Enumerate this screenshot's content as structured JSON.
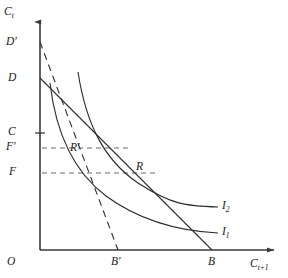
{
  "figure": {
    "background_color": "#ffffff",
    "line_color": "#2e2e2e",
    "axis_color": "#3a3a3a",
    "guide_color": "#6d6d6d"
  },
  "axes": {
    "y_label": "C",
    "y_label_sub": "t",
    "x_label": "C",
    "x_label_sub": "t+1",
    "origin_label": "O",
    "x_axis_y_px": 250,
    "y_axis_x_px": 40,
    "x_axis_end_px": 278,
    "y_axis_top_px": 18
  },
  "y_axis_marks": [
    {
      "label": "D",
      "prime": "′",
      "text": "D′",
      "y_px": 42,
      "has_tick": false
    },
    {
      "label": "D",
      "prime": "",
      "text": "D",
      "y_px": 78,
      "has_tick": false
    },
    {
      "label": "C",
      "prime": "",
      "text": "C",
      "y_px": 133,
      "has_tick": true
    },
    {
      "label": "F",
      "prime": "′",
      "text": "F′",
      "y_px": 148,
      "has_tick": false
    },
    {
      "label": "F",
      "prime": "",
      "text": "F",
      "y_px": 173,
      "has_tick": false
    }
  ],
  "x_axis_marks": [
    {
      "text": "B′",
      "x_px": 118
    },
    {
      "text": "B",
      "x_px": 212
    }
  ],
  "points": [
    {
      "text": "R′",
      "name": "point-r-prime",
      "x_px": 65,
      "y_px": 148
    },
    {
      "text": "R",
      "name": "point-r",
      "x_px": 130,
      "y_px": 173
    }
  ],
  "curves": [
    {
      "name": "indifference-curve-i1",
      "label": "I",
      "label_sub": "1",
      "label_text": "I₁",
      "style": "solid",
      "path": "M 50,83 C 56,135 74,172 106,196 C 140,221 180,231 218,233"
    },
    {
      "name": "indifference-curve-i2",
      "label": "I",
      "label_sub": "2",
      "label_text": "I₂",
      "style": "solid",
      "path": "M 78,72 C 86,124 104,160 138,183 C 172,205 186,206 218,207"
    },
    {
      "name": "budget-line-db",
      "label": "DB",
      "style": "solid",
      "path": "M 40,78 L 212,250"
    },
    {
      "name": "budget-line-dprime-bprime",
      "label": "D'B'",
      "style": "dashed",
      "path": "M 40,42 L 118,250"
    }
  ],
  "guides": [
    {
      "name": "guide-f-prime",
      "from_x": 42,
      "to_x": 130,
      "y_px": 148
    },
    {
      "name": "guide-f",
      "from_x": 42,
      "to_x": 155,
      "y_px": 173
    }
  ],
  "legend_labels": [
    {
      "text": "I₁",
      "name": "curve-label-i1"
    },
    {
      "text": "I₂",
      "name": "curve-label-i2"
    }
  ]
}
